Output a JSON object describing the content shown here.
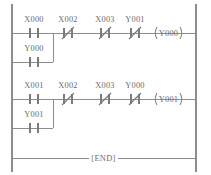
{
  "diagram": {
    "style": {
      "background": "#fefefe",
      "wire_color": "#8d8d8d",
      "symbol_color": "#7b7b7b",
      "text_color": "#6f6f6f"
    },
    "rails": {
      "left_x": 12,
      "right_x": 196,
      "top_y": 4,
      "bottom_y": 172
    },
    "rungs": [
      {
        "id": "rung-1",
        "y": 33,
        "main_contacts": [
          {
            "id": "r1-c1",
            "label": "X000",
            "type": "normally-open",
            "x": 34
          },
          {
            "id": "r1-c2",
            "label": "X002",
            "type": "normally-closed",
            "x": 68
          },
          {
            "id": "r1-c3",
            "label": "X003",
            "type": "normally-closed",
            "x": 105
          },
          {
            "id": "r1-c4",
            "label": "Y001",
            "type": "normally-closed",
            "x": 135
          }
        ],
        "coil": {
          "id": "r1-coil",
          "label": "Y000",
          "x": 168
        },
        "branch": {
          "id": "rung-1-branch",
          "y": 62,
          "merge_x": 53,
          "contacts": [
            {
              "id": "r1-b1",
              "label": "Y000",
              "type": "normally-open",
              "x": 34
            }
          ]
        }
      },
      {
        "id": "rung-2",
        "y": 99,
        "main_contacts": [
          {
            "id": "r2-c1",
            "label": "X001",
            "type": "normally-open",
            "x": 34
          },
          {
            "id": "r2-c2",
            "label": "X002",
            "type": "normally-closed",
            "x": 68
          },
          {
            "id": "r2-c3",
            "label": "X003",
            "type": "normally-closed",
            "x": 105
          },
          {
            "id": "r2-c4",
            "label": "Y000",
            "type": "normally-closed",
            "x": 135
          }
        ],
        "coil": {
          "id": "r2-coil",
          "label": "Y001",
          "x": 168
        },
        "branch": {
          "id": "rung-2-branch",
          "y": 128,
          "merge_x": 53,
          "contacts": [
            {
              "id": "r2-b1",
              "label": "Y001",
              "type": "normally-open",
              "x": 34
            }
          ]
        }
      }
    ],
    "end_rung": {
      "id": "rung-end",
      "y": 158,
      "label": "[END]",
      "x": 103
    }
  }
}
